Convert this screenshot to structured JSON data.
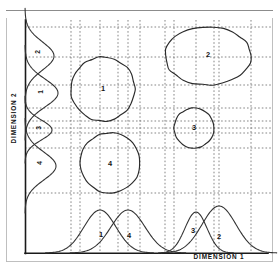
{
  "figure": {
    "background_color": "#ffffff",
    "line_color": "#2b2b2b",
    "grid_color": "#6f6f6f"
  },
  "axes": {
    "x_title": "DIMENSION 1",
    "y_title": "DIMENSION 2",
    "x_axis_y": 253,
    "y_axis_x": 25,
    "plot_left": 25,
    "plot_right": 272,
    "plot_top": 20,
    "plot_bottom": 253
  },
  "chart_data": {
    "type": "scatter",
    "xlabel": "DIMENSION 1",
    "ylabel": "DIMENSION 2",
    "xlim": [
      25,
      272
    ],
    "ylim": [
      20,
      253
    ],
    "grid": true,
    "legend": "none",
    "clusters": [
      {
        "label": "1",
        "shape": "circle",
        "cx": 103,
        "cy": 89,
        "rx": 32,
        "ry": 32,
        "x_extent": [
          71,
          135
        ],
        "y_extent": [
          57,
          121
        ],
        "label_x": 103,
        "label_y": 89
      },
      {
        "label": "2",
        "shape": "ellipse",
        "cx": 208,
        "cy": 56,
        "rx": 43,
        "ry": 29,
        "x_extent": [
          165,
          251
        ],
        "y_extent": [
          27,
          85
        ],
        "label_x": 208,
        "label_y": 55
      },
      {
        "label": "3",
        "shape": "circle",
        "cx": 194,
        "cy": 128,
        "rx": 20,
        "ry": 20,
        "x_extent": [
          174,
          214
        ],
        "y_extent": [
          108,
          148
        ],
        "label_x": 194,
        "label_y": 128
      },
      {
        "label": "4",
        "shape": "circle",
        "cx": 110,
        "cy": 163,
        "rx": 30,
        "ry": 30,
        "x_extent": [
          80,
          140
        ],
        "y_extent": [
          133,
          193
        ],
        "label_x": 110,
        "label_y": 164
      }
    ],
    "x_marginal_densities": [
      {
        "label": "1",
        "peak_x": 100,
        "sigma": 16,
        "height": 43,
        "label_x": 101,
        "label_y": 235
      },
      {
        "label": "4",
        "peak_x": 128,
        "sigma": 17,
        "height": 43,
        "label_x": 129,
        "label_y": 236
      },
      {
        "label": "3",
        "peak_x": 196,
        "sigma": 11,
        "height": 41,
        "label_x": 193,
        "label_y": 231
      },
      {
        "label": "2",
        "peak_x": 219,
        "sigma": 17,
        "height": 47,
        "label_x": 219,
        "label_y": 237
      }
    ],
    "y_marginal_densities": [
      {
        "label": "2",
        "peak_y": 56,
        "sigma": 14,
        "width": 29,
        "label_x": 38,
        "label_y": 52
      },
      {
        "label": "1",
        "peak_y": 93,
        "sigma": 14,
        "width": 33,
        "label_x": 41,
        "label_y": 92
      },
      {
        "label": "3",
        "peak_y": 130,
        "sigma": 10,
        "width": 27,
        "label_x": 39,
        "label_y": 128
      },
      {
        "label": "4",
        "peak_y": 166,
        "sigma": 14,
        "width": 31,
        "label_x": 40,
        "label_y": 163
      }
    ],
    "x_projection_gridlines": [
      71,
      80,
      100,
      118,
      128,
      140,
      165,
      174,
      196,
      214,
      219,
      251
    ],
    "y_projection_gridlines": [
      27,
      57,
      85,
      108,
      121,
      128,
      133,
      148,
      193
    ]
  }
}
